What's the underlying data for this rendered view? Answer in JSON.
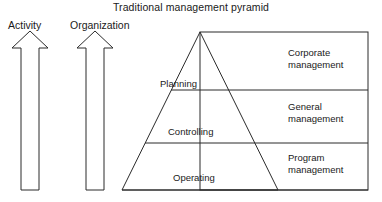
{
  "title": "Traditional management pyramid",
  "axes": [
    {
      "name": "activity",
      "label": "Activity"
    },
    {
      "name": "organization",
      "label": "Organization"
    }
  ],
  "pyramid": {
    "tiers": [
      {
        "label": "Planning"
      },
      {
        "label": "Controlling"
      },
      {
        "label": "Operating"
      }
    ]
  },
  "management_levels": [
    {
      "line1": "Corporate",
      "line2": "management"
    },
    {
      "line1": "General",
      "line2": "management"
    },
    {
      "line1": "Program",
      "line2": "management"
    }
  ],
  "colors": {
    "stroke": "#2b2b2b",
    "background": "#ffffff",
    "text": "#1a1a1a"
  },
  "geometry": {
    "pyramid_apex_x": 200,
    "pyramid_apex_y": 32,
    "pyramid_base_y": 190,
    "pyramid_base_left_x": 122,
    "pyramid_base_right_x": 278,
    "panel_right_x": 368,
    "divider_y_1": 90,
    "divider_y_2": 143
  }
}
